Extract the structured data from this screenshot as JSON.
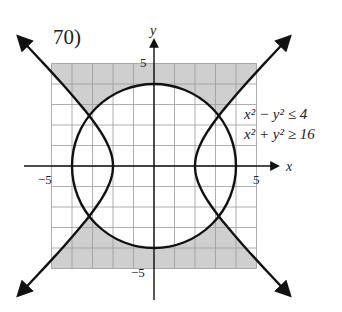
{
  "problem_number": "70)",
  "chart_data": {
    "type": "region-graph",
    "title": "70)",
    "xlabel": "x",
    "ylabel": "y",
    "xlim": [
      -5,
      5
    ],
    "ylim": [
      -5,
      5
    ],
    "grid": true,
    "x_ticks_labeled": [
      "-5",
      "5"
    ],
    "y_ticks_labeled": [
      "5",
      "-5"
    ],
    "inequalities": [
      "x² − y² ≤ 4",
      "x² + y² ≥ 16"
    ],
    "curves": [
      {
        "name": "circle",
        "equation": "x^2 + y^2 = 16",
        "radius": 4,
        "center": [
          0,
          0
        ]
      },
      {
        "name": "hyperbola",
        "equation": "x^2 - y^2 = 4",
        "vertices": [
          [
            -2,
            0
          ],
          [
            2,
            0
          ]
        ]
      }
    ],
    "shaded_region": "outside circle and between hyperbola branches (top and bottom regions)",
    "shade_color": "#cfcfcf"
  },
  "labels": {
    "x_axis": "x",
    "y_axis": "y",
    "tick_neg5_x": "−5",
    "tick_pos5_x": "5",
    "tick_pos5_y": "5",
    "tick_neg5_y": "−5",
    "ineq1": "x² − y² ≤ 4",
    "ineq2": "x² + y² ≥ 16"
  }
}
